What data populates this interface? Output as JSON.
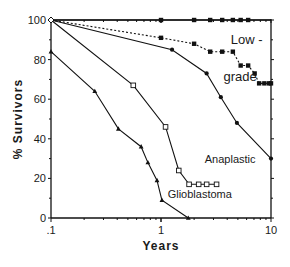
{
  "chart_data": {
    "type": "line",
    "title": "",
    "xlabel": "Years",
    "ylabel": "% Survivors",
    "xscale": "log",
    "xlim": [
      0.1,
      10
    ],
    "ylim": [
      0,
      100
    ],
    "x_ticks": [
      ".1",
      "1",
      "10"
    ],
    "y_ticks": [
      "0",
      "20",
      "40",
      "60",
      "80",
      "100"
    ],
    "grid": false,
    "legend": "inline labels",
    "annotations": [
      {
        "text": "Low -",
        "x": 4.3,
        "y": 88
      },
      {
        "text": "grade",
        "x": 3.7,
        "y": 69
      },
      {
        "text": "Anaplastic",
        "x": 2.5,
        "y": 28
      },
      {
        "text": "Glioblastoma",
        "x": 1.15,
        "y": 10
      }
    ],
    "series": [
      {
        "name": "Low-grade (top, 100% survival)",
        "style": "solid",
        "marker": "filled-square",
        "x": [
          0.1,
          1.0,
          2.0,
          2.8,
          3.6,
          4.5,
          5.3,
          6.2,
          10
        ],
        "y": [
          100,
          100,
          100,
          100,
          100,
          100,
          100,
          100,
          100
        ]
      },
      {
        "name": "Low-grade (dotted)",
        "style": "dotted",
        "marker": "filled-square",
        "x": [
          0.1,
          1.0,
          2.0,
          2.8,
          3.6,
          4.5,
          5.3,
          6.2,
          7.1,
          7.8,
          8.7,
          9.6,
          10
        ],
        "y": [
          100,
          91,
          88,
          84,
          84,
          84,
          77,
          77,
          73,
          68,
          68,
          68,
          68
        ]
      },
      {
        "name": "grade",
        "style": "solid",
        "marker": "filled-circle",
        "x": [
          0.1,
          1.26,
          2.6,
          3.5,
          4.9,
          10
        ],
        "y": [
          100,
          85,
          73,
          61,
          48,
          30
        ]
      },
      {
        "name": "Anaplastic",
        "style": "solid",
        "marker": "open-square",
        "x": [
          0.1,
          0.56,
          1.1,
          1.45,
          1.8,
          2.2,
          2.6,
          3.2
        ],
        "y": [
          100,
          67,
          46,
          24,
          17,
          17,
          17,
          17
        ]
      },
      {
        "name": "Glioblastoma",
        "style": "solid",
        "marker": "filled-triangle",
        "x": [
          0.1,
          0.25,
          0.41,
          0.66,
          0.76,
          0.92,
          1.02,
          1.77
        ],
        "y": [
          84,
          64,
          45,
          36,
          28,
          19,
          9,
          0
        ]
      }
    ]
  }
}
